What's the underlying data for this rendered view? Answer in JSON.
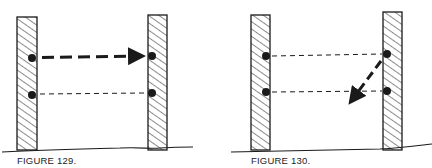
{
  "figures": [
    {
      "caption": "FIGURE 129.",
      "description": "Two hatched posts with two dots each; thick dashed arrow from upper-left dot to upper-right dot; thin dashed line connecting lower dots"
    },
    {
      "caption": "FIGURE 130.",
      "description": "Two hatched posts with two dots each; thin dashed lines connecting upper and lower dots; thick dashed arrow from upper-right dot pointing down-left"
    }
  ],
  "colors": {
    "ink": "#1a1a1a",
    "background": "#ffffff"
  }
}
